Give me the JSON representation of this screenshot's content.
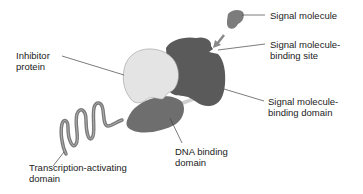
{
  "diagram": {
    "colors": {
      "background": "#ffffff",
      "receptor_dark": "#5a5a5a",
      "dna_domain": "#6e6e6e",
      "inhibitor_light": "#e4e4e4",
      "signal_molecule": "#7c7c7c",
      "coil": "#7a7a7a",
      "leader_line": "#444444",
      "text": "#222222"
    },
    "labels": {
      "signal_molecule": "Signal molecule",
      "binding_site_line1": "Signal molecule-",
      "binding_site_line2": "binding site",
      "inhibitor_line1": "Inhibitor",
      "inhibitor_line2": "protein",
      "binding_domain_line1": "Signal molecule-",
      "binding_domain_line2": "binding domain",
      "dna_line1": "DNA binding",
      "dna_line2": "domain",
      "transcription_line1": "Transcription-activating",
      "transcription_line2": "domain"
    }
  }
}
